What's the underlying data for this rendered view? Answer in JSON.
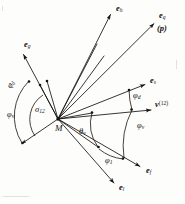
{
  "figure": {
    "name": "vector-angle-diagram",
    "background": "#fdfdfc",
    "ink": "#15130f",
    "origin_label": "M",
    "width": 185,
    "height": 204
  },
  "vectors": [
    {
      "id": "e_g",
      "label": "e",
      "sub": "g",
      "label_x": 24,
      "label_y": 45,
      "from": [
        58,
        119
      ],
      "to": [
        22,
        53
      ],
      "dot": null
    },
    {
      "id": "e_h",
      "label": "e",
      "sub": "h",
      "label_x": 116,
      "label_y": 8,
      "from": [
        58,
        119
      ],
      "to": [
        110,
        13
      ],
      "dot": null
    },
    {
      "id": "e_q",
      "label": "e",
      "sub": "q",
      "label_x": 160,
      "label_y": 14,
      "from": [
        58,
        119
      ],
      "to": [
        155,
        22
      ],
      "dot": null
    },
    {
      "id": "e_s",
      "label": "e",
      "sub": "s",
      "label_x": 150,
      "label_y": 80,
      "from": [
        58,
        119
      ],
      "to": [
        146,
        84
      ],
      "dot": [
        129,
        90
      ]
    },
    {
      "id": "v_12",
      "label": "v",
      "sup": "(12)",
      "label_x": 158,
      "label_y": 104,
      "from": [
        58,
        119
      ],
      "to": [
        152,
        110
      ],
      "dot": [
        131,
        109
      ]
    },
    {
      "id": "e_f",
      "label": "e",
      "sub": "f",
      "label_x": 148,
      "label_y": 170,
      "from": [
        58,
        119
      ],
      "to": [
        141,
        167
      ],
      "dot": [
        123,
        158
      ]
    },
    {
      "id": "e_l",
      "label": "e",
      "sub": "l",
      "label_x": 121,
      "label_y": 186,
      "from": [
        58,
        119
      ],
      "to": [
        115,
        184
      ],
      "dot": [
        99,
        170
      ]
    },
    {
      "id": "e_left_low",
      "label": "",
      "sub": "",
      "label_x": 0,
      "label_y": 0,
      "from": [
        58,
        119
      ],
      "to": [
        21,
        144
      ],
      "dot": [
        26,
        141
      ]
    }
  ],
  "angles": [
    {
      "id": "phi_d",
      "symbol": "φ",
      "sub": "d",
      "label_x": 10,
      "label_y": 79,
      "rotated": true
    },
    {
      "id": "phi_v_left",
      "symbol": "φ",
      "sub": "v",
      "label_x": 8,
      "label_y": 114,
      "rotated": false
    },
    {
      "id": "sigma_12",
      "symbol": "σ",
      "sub": "12",
      "label_x": 36,
      "label_y": 109,
      "rotated": false
    },
    {
      "id": "theta_v",
      "symbol": "θ",
      "sub": "v",
      "label_x": 79,
      "label_y": 131,
      "rotated": false
    },
    {
      "id": "phi_1",
      "symbol": "φ",
      "sub": "1",
      "label_x": 106,
      "label_y": 160,
      "rotated": false
    },
    {
      "id": "phi_d_right",
      "symbol": "φ",
      "sub": "d",
      "label_x": 133,
      "label_y": 95,
      "rotated": false
    },
    {
      "id": "phi_v_right",
      "symbol": "φ",
      "sub": "v",
      "label_x": 138,
      "label_y": 125,
      "rotated": false
    }
  ],
  "annotations": {
    "p_paren": "(p)",
    "p_paren_x": 158,
    "p_paren_y": 27
  },
  "origin": {
    "label": "M",
    "x": 55,
    "y": 124
  }
}
